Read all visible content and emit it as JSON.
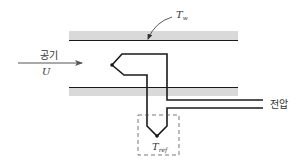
{
  "diagram": {
    "labels": {
      "wall_temperature": "T",
      "wall_temperature_sub": "w",
      "air": "공기",
      "velocity": "U",
      "voltage": "전압",
      "reference_temperature": "T",
      "reference_temperature_sub": "ref"
    },
    "colors": {
      "wall_fill": "#d9d9d9",
      "line": "#1a1a1a",
      "dashed_box": "#555555",
      "arrow": "#555555"
    },
    "components": [
      {
        "id": "top-wall",
        "type": "duct-wall",
        "x1": 69,
        "x2": 238,
        "band_y": [
          31,
          40
        ],
        "edge_y": 40
      },
      {
        "id": "bottom-wall",
        "type": "duct-wall",
        "x1": 69,
        "x2": 238,
        "band_y": [
          88,
          96
        ],
        "edge_y": 87
      },
      {
        "id": "measuring-junction",
        "type": "thermocouple-junction",
        "x": 112,
        "y": 65
      },
      {
        "id": "reference-junction",
        "type": "thermocouple-junction",
        "x": 157,
        "y": 136
      },
      {
        "id": "reference-box",
        "type": "dashed-enclosure",
        "x": 138,
        "y": 115,
        "w": 41,
        "h": 40
      },
      {
        "id": "flow-arrow",
        "type": "arrow",
        "from": [
          18,
          63
        ],
        "to": [
          82,
          63
        ]
      },
      {
        "id": "voltage-leads",
        "type": "wire-pair",
        "end_x": 263,
        "y": [
          100,
          108
        ]
      }
    ]
  }
}
